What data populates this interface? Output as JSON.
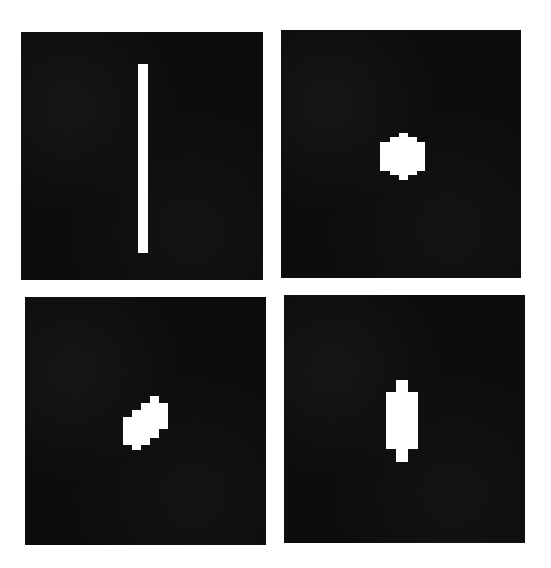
{
  "figure": {
    "background_color": "#ffffff",
    "panel_color": "#0d0d0d",
    "shape_color": "#ffffff",
    "panels": [
      {
        "id": "top-left",
        "description": "thin vertical white bar",
        "box": {
          "x": 21,
          "y": 32,
          "w": 242,
          "h": 248
        },
        "shape": "bar",
        "shape_box": {
          "x": 138,
          "y": 64,
          "w": 10,
          "h": 189
        }
      },
      {
        "id": "top-right",
        "description": "small compact stepped blob (roughly octagonal)",
        "box": {
          "x": 281,
          "y": 30,
          "w": 240,
          "h": 248
        },
        "shape": "compact-blob",
        "shape_box": {
          "x": 380,
          "y": 133,
          "w": 45,
          "h": 46
        }
      },
      {
        "id": "bottom-left",
        "description": "stepped blob slanted diagonally up-right",
        "box": {
          "x": 25,
          "y": 297,
          "w": 241,
          "h": 248
        },
        "shape": "slanted-blob",
        "shape_box": {
          "x": 123,
          "y": 396,
          "w": 45,
          "h": 54
        }
      },
      {
        "id": "bottom-right",
        "description": "vertical stepped elongated blob with narrow ends",
        "box": {
          "x": 284,
          "y": 295,
          "w": 241,
          "h": 248
        },
        "shape": "elongated-blob",
        "shape_box": {
          "x": 391,
          "y": 380,
          "w": 27,
          "h": 82
        }
      }
    ]
  }
}
